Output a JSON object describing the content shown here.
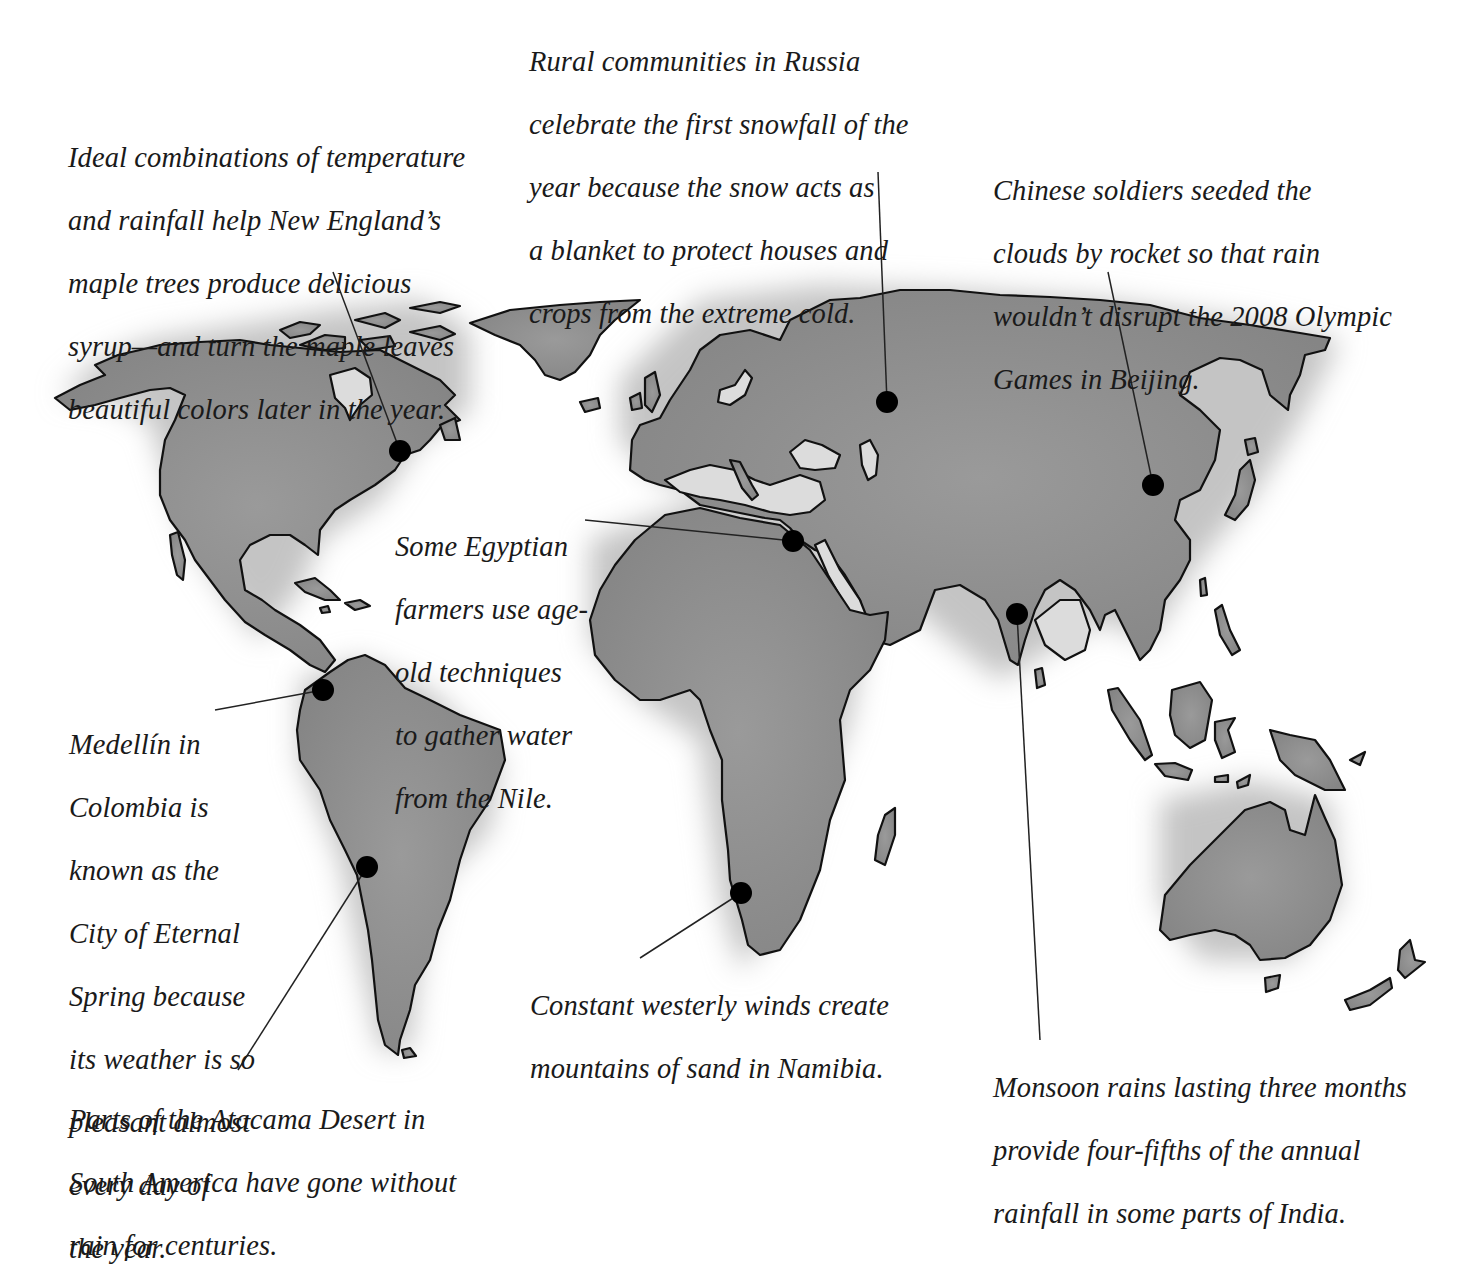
{
  "colors": {
    "land": "#8f8f8f",
    "land_outline": "#111111",
    "shadow": "#bdbdbd",
    "marker": "#000000",
    "leader": "#222222",
    "text": "#1a1a1a",
    "background": "#ffffff"
  },
  "annotations": {
    "new_england": {
      "lines": [
        "Ideal combinations of temperature",
        "and rainfall help New England’s",
        "maple trees produce delicious",
        "syrup—and turn the maple leaves",
        "beautiful colors later in the year."
      ]
    },
    "russia": {
      "lines": [
        "Rural communities in Russia",
        "celebrate the first snowfall of the",
        "year because the snow acts as",
        "a blanket to protect houses and",
        "crops from the extreme cold."
      ]
    },
    "beijing": {
      "lines": [
        "Chinese soldiers seeded the",
        "clouds by rocket so that rain",
        "wouldn’t disrupt the 2008 Olympic",
        "Games in Beijing."
      ]
    },
    "egypt": {
      "lines": [
        "Some Egyptian",
        "farmers use age-",
        "old techniques",
        "to gather water",
        "from the Nile."
      ]
    },
    "medellin": {
      "lines": [
        "Medellín in",
        "Colombia is",
        "known as the",
        "City of Eternal",
        "Spring because",
        "its weather is so",
        "pleasant almost",
        "every day of",
        "the year."
      ]
    },
    "atacama": {
      "lines": [
        "Parts of the Atacama Desert in",
        "South America have gone without",
        "rain for centuries."
      ]
    },
    "namibia": {
      "lines": [
        "Constant westerly winds create",
        "mountains of sand in Namibia."
      ]
    },
    "india": {
      "lines": [
        "Monsoon rains lasting three months",
        "provide four-fifths of the annual",
        "rainfall in some parts of India."
      ]
    }
  },
  "markers": [
    {
      "id": "new_england",
      "icon": "location-dot-icon",
      "x": 400,
      "y": 451
    },
    {
      "id": "russia",
      "icon": "location-dot-icon",
      "x": 887,
      "y": 402
    },
    {
      "id": "beijing",
      "icon": "location-dot-icon",
      "x": 1153,
      "y": 485
    },
    {
      "id": "egypt",
      "icon": "location-dot-icon",
      "x": 793,
      "y": 541
    },
    {
      "id": "india",
      "icon": "location-dot-icon",
      "x": 1017,
      "y": 614
    },
    {
      "id": "medellin",
      "icon": "location-dot-icon",
      "x": 323,
      "y": 690
    },
    {
      "id": "atacama",
      "icon": "location-dot-icon",
      "x": 367,
      "y": 867
    },
    {
      "id": "namibia",
      "icon": "location-dot-icon",
      "x": 741,
      "y": 893
    }
  ]
}
